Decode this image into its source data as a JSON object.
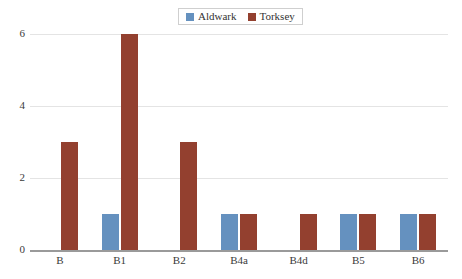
{
  "chart_data": {
    "type": "bar",
    "title": "",
    "subtitle": "",
    "xlabel": "",
    "ylabel": "",
    "categories": [
      "B",
      "B1",
      "B2",
      "B4a",
      "B4d",
      "B5",
      "B6"
    ],
    "series": [
      {
        "name": "Aldwark",
        "color": "#6591bf",
        "values": [
          0,
          1,
          0,
          1,
          0,
          1,
          1
        ]
      },
      {
        "name": "Torksey",
        "color": "#93402f",
        "values": [
          3,
          6,
          3,
          1,
          1,
          1,
          1
        ]
      }
    ],
    "ylim": [
      0,
      6
    ],
    "yticks": [
      0,
      2,
      4,
      6
    ],
    "ytick_labels": [
      "0",
      "2",
      "4",
      "6"
    ],
    "grid": true,
    "grid_axis": "y",
    "grid_color": "#e4e4e4",
    "axis_color": "#9a9a9a",
    "legend": {
      "position": "top-center",
      "border_color": "#cfcfcf",
      "entries": [
        {
          "label": "Aldwark",
          "color": "#6591bf"
        },
        {
          "label": "Torksey",
          "color": "#93402f"
        }
      ]
    },
    "background": "#ffffff"
  }
}
